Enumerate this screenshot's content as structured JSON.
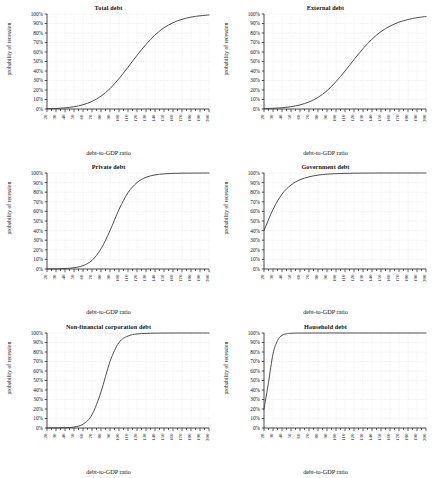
{
  "figure": {
    "panel_count": 6,
    "layout": "3 rows x 2 columns",
    "axis": {
      "xlabel": "debt-to-GDP ratio",
      "ylabel": "probability of recession",
      "xticks": [
        "20",
        "30",
        "40",
        "50",
        "60",
        "70",
        "80",
        "90",
        "100",
        "110",
        "120",
        "130",
        "140",
        "150",
        "160",
        "170",
        "180",
        "190",
        "200"
      ],
      "yticks": [
        "0%",
        "10%",
        "20%",
        "30%",
        "40%",
        "50%",
        "60%",
        "70%",
        "80%",
        "90%",
        "100%"
      ],
      "xlim": [
        20,
        200
      ],
      "ylim": [
        0,
        100
      ],
      "minor_tick_step": 5,
      "grid": "dotted-light-gray"
    },
    "colors": {
      "curve": "#3a3a3a",
      "axis": "#222222",
      "grid": "#d9d9d9",
      "background": "#ffffff",
      "text": "#111111"
    }
  },
  "chart_data": [
    {
      "type": "line",
      "title": "Total debt",
      "xlabel": "debt-to-GDP ratio",
      "ylabel": "probability of recession",
      "xlim": [
        20,
        200
      ],
      "ylim": [
        0,
        100
      ],
      "grid": true,
      "legend": "none",
      "x": [
        20,
        30,
        40,
        50,
        60,
        70,
        80,
        90,
        100,
        110,
        120,
        130,
        140,
        150,
        160,
        170,
        180,
        190,
        200
      ],
      "values": [
        0.3,
        0.6,
        1.2,
        2.4,
        4.5,
        8.0,
        13.5,
        21.5,
        32.0,
        44.0,
        56.5,
        68.0,
        78.0,
        85.5,
        90.8,
        94.4,
        96.7,
        98.1,
        99.0
      ]
    },
    {
      "type": "line",
      "title": "External debt",
      "xlabel": "debt-to-GDP ratio",
      "ylabel": "probability of recession",
      "xlim": [
        20,
        200
      ],
      "ylim": [
        0,
        100
      ],
      "grid": true,
      "legend": "none",
      "x": [
        20,
        30,
        40,
        50,
        60,
        70,
        80,
        90,
        100,
        110,
        120,
        130,
        140,
        150,
        160,
        170,
        180,
        190,
        200
      ],
      "values": [
        0.4,
        0.7,
        1.3,
        2.4,
        4.3,
        7.4,
        12.2,
        19.3,
        28.8,
        40.0,
        52.0,
        63.5,
        73.5,
        81.5,
        87.3,
        91.4,
        94.2,
        96.1,
        97.3
      ]
    },
    {
      "type": "line",
      "title": "Private debt",
      "xlabel": "debt-to-GDP ratio",
      "ylabel": "probability of recession",
      "xlim": [
        20,
        200
      ],
      "ylim": [
        0,
        100
      ],
      "grid": true,
      "legend": "none",
      "x": [
        20,
        30,
        40,
        50,
        60,
        70,
        80,
        90,
        100,
        110,
        120,
        130,
        140,
        150,
        160,
        170,
        180,
        190,
        200
      ],
      "values": [
        0.1,
        0.2,
        0.5,
        1.3,
        3.5,
        9.0,
        21.0,
        40.0,
        62.0,
        79.5,
        90.0,
        95.5,
        98.0,
        99.1,
        99.6,
        99.8,
        99.9,
        99.95,
        100.0
      ]
    },
    {
      "type": "line",
      "title": "Government debt",
      "xlabel": "debt-to-GDP ratio",
      "ylabel": "probability of recession",
      "xlim": [
        20,
        200
      ],
      "ylim": [
        0,
        100
      ],
      "grid": true,
      "legend": "none",
      "x": [
        20,
        30,
        40,
        50,
        60,
        70,
        80,
        90,
        100,
        110,
        120,
        130,
        140,
        150,
        160,
        170,
        180,
        190,
        200
      ],
      "values": [
        40.0,
        62.0,
        78.0,
        87.5,
        93.0,
        96.0,
        97.8,
        98.8,
        99.3,
        99.6,
        99.8,
        99.9,
        99.95,
        100.0,
        100.0,
        100.0,
        100.0,
        100.0,
        100.0
      ]
    },
    {
      "type": "line",
      "title": "Non-financial corporation debt",
      "xlabel": "debt-to-GDP ratio",
      "ylabel": "probability of recession",
      "xlim": [
        20,
        200
      ],
      "ylim": [
        0,
        100
      ],
      "grid": true,
      "legend": "none",
      "x": [
        20,
        30,
        40,
        50,
        60,
        70,
        80,
        90,
        100,
        110,
        120,
        130,
        140,
        150,
        160,
        170,
        180,
        190,
        200
      ],
      "values": [
        0.05,
        0.1,
        0.3,
        1.0,
        4.0,
        14.0,
        38.0,
        70.0,
        90.0,
        96.8,
        99.0,
        99.6,
        99.85,
        99.95,
        100.0,
        100.0,
        100.0,
        100.0,
        100.0
      ]
    },
    {
      "type": "line",
      "title": "Household debt",
      "xlabel": "debt-to-GDP ratio",
      "ylabel": "probability of recession",
      "xlim": [
        20,
        200
      ],
      "ylim": [
        0,
        100
      ],
      "grid": true,
      "legend": "none",
      "x": [
        20,
        25,
        30,
        35,
        40,
        45,
        50,
        60,
        70,
        80,
        90,
        100,
        110,
        120,
        130,
        140,
        150,
        160,
        170,
        180,
        190,
        200
      ],
      "values": [
        20.0,
        48.0,
        78.0,
        92.0,
        97.5,
        99.2,
        99.7,
        99.95,
        100.0,
        100.0,
        100.0,
        100.0,
        100.0,
        100.0,
        100.0,
        100.0,
        100.0,
        100.0,
        100.0,
        100.0,
        100.0,
        100.0
      ]
    }
  ]
}
